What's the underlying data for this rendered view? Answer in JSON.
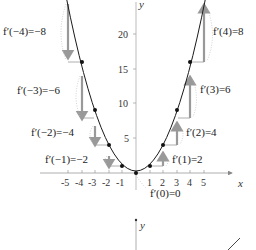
{
  "diagram": {
    "function": "f(x)=x^2",
    "axes": {
      "x_label": "x",
      "y_label": "y",
      "x_ticks": [
        "-5",
        "-4",
        "-3",
        "-2",
        "-1",
        "1",
        "2",
        "3",
        "4",
        "5"
      ],
      "y_ticks": [
        "5",
        "10",
        "15",
        "20"
      ]
    },
    "derivative_labels": {
      "m4": "f′(−4)=−8",
      "m3": "f′(−3)=−6",
      "m2": "f′(−2)=−4",
      "m1": "f′(−1)=−2",
      "zero": "f′(0)=0",
      "p1": "f′(1)=2",
      "p2": "f′(2)=4",
      "p3": "f′(3)=6",
      "p4": "f′(4)=8"
    },
    "points_x": [
      -5,
      -4,
      -3,
      -2,
      -1,
      0,
      1,
      2,
      3,
      4,
      5
    ],
    "lower_diagram": {
      "y_label": "y"
    },
    "colors": {
      "curve": "#1a1a1a",
      "arrow": "#9a9a9a",
      "axis": "#888888",
      "dotted": "#b0b0b0"
    }
  }
}
